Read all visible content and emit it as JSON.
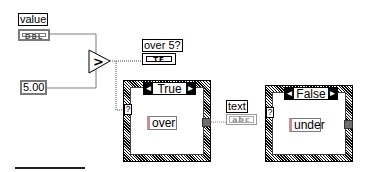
{
  "diagram": {
    "controls": {
      "value": {
        "label": "value",
        "type_badge": "DBL"
      },
      "threshold_constant": {
        "value": "5.00"
      }
    },
    "comparator": {
      "symbol": ">"
    },
    "indicators": {
      "over5": {
        "label": "over 5?",
        "type_badge": "TF"
      },
      "text": {
        "label": "text",
        "type_badge": "abc"
      }
    },
    "case_true": {
      "selector_label": "True",
      "selector_terminal": "?",
      "string_constant": "over",
      "left_arrow": "◄",
      "right_arrow": "►"
    },
    "case_false": {
      "selector_label": "False",
      "selector_terminal": "?",
      "string_constant": "under",
      "left_arrow": "◄",
      "right_arrow": "►"
    },
    "colors": {
      "wire_numeric": "#7a7a7a",
      "wire_boolean": "#555555",
      "wire_string": "#c89090",
      "tunnel": "#6e6e6e"
    }
  }
}
